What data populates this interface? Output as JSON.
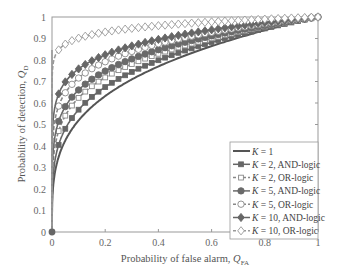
{
  "chart_data": {
    "type": "line",
    "title": "",
    "xlabel": "Probability of false alarm, Q_FA",
    "ylabel": "Probability of detection, Q_D",
    "xlim": [
      0,
      1
    ],
    "ylim": [
      0,
      1
    ],
    "xticks": [
      "0",
      "0.2",
      "0.4",
      "0.6",
      "0.8",
      "1"
    ],
    "yticks": [
      "0",
      "0.1",
      "0.2",
      "0.3",
      "0.4",
      "0.5",
      "0.6",
      "0.7",
      "0.8",
      "0.9",
      "1"
    ],
    "grid": false,
    "legend_position": "lower right",
    "x": [
      0,
      0.01,
      0.025,
      0.05,
      0.1,
      0.2,
      0.3,
      0.4,
      0.5,
      0.6,
      0.7,
      0.8,
      0.9,
      1.0
    ],
    "series": [
      {
        "name": "K = 1",
        "exponent": 0.285,
        "marker": "none",
        "style": "solid",
        "values": [
          0,
          0.27,
          0.35,
          0.43,
          0.52,
          0.63,
          0.71,
          0.77,
          0.82,
          0.86,
          0.9,
          0.94,
          0.97,
          1.0
        ]
      },
      {
        "name": "K = 2, AND-logic",
        "exponent": 0.245,
        "marker": "filled-square",
        "style": "solid",
        "values": [
          0,
          0.32,
          0.4,
          0.48,
          0.57,
          0.67,
          0.74,
          0.8,
          0.84,
          0.88,
          0.92,
          0.95,
          0.97,
          1.0
        ]
      },
      {
        "name": "K = 2, OR-logic",
        "exponent": 0.205,
        "marker": "open-square",
        "style": "dashed",
        "values": [
          0,
          0.39,
          0.47,
          0.54,
          0.62,
          0.72,
          0.78,
          0.83,
          0.87,
          0.9,
          0.93,
          0.96,
          0.98,
          1.0
        ]
      },
      {
        "name": "K = 5, AND-logic",
        "exponent": 0.18,
        "marker": "filled-circle",
        "style": "solid",
        "values": [
          0,
          0.44,
          0.51,
          0.58,
          0.66,
          0.75,
          0.81,
          0.85,
          0.88,
          0.91,
          0.94,
          0.96,
          0.98,
          1.0
        ]
      },
      {
        "name": "K = 5, OR-logic",
        "exponent": 0.145,
        "marker": "open-circle",
        "style": "dashed",
        "values": [
          0,
          0.51,
          0.59,
          0.65,
          0.72,
          0.79,
          0.84,
          0.88,
          0.9,
          0.93,
          0.95,
          0.97,
          0.98,
          1.0
        ]
      },
      {
        "name": "K = 10, AND-logic",
        "exponent": 0.12,
        "marker": "filled-diamond",
        "style": "solid",
        "values": [
          0,
          0.58,
          0.64,
          0.7,
          0.76,
          0.82,
          0.87,
          0.9,
          0.92,
          0.94,
          0.96,
          0.97,
          0.99,
          1.0
        ]
      },
      {
        "name": "K = 10, OR-logic",
        "exponent": 0.045,
        "marker": "open-diamond",
        "style": "dashed",
        "values": [
          0,
          0.81,
          0.85,
          0.87,
          0.9,
          0.93,
          0.95,
          0.96,
          0.97,
          0.98,
          0.98,
          0.99,
          1.0,
          1.0
        ]
      }
    ]
  }
}
